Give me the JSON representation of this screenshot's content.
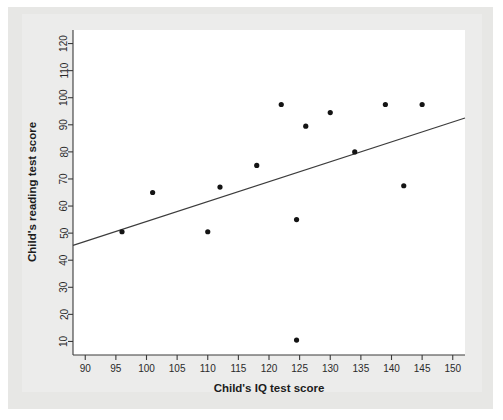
{
  "figure": {
    "background_color": "#e7e7e5",
    "panel_color": "#ececeb",
    "plot_background": "#ffffff"
  },
  "chart_data": {
    "type": "scatter",
    "title": "",
    "xlabel": "Child's IQ test score",
    "ylabel": "Child's reading test score",
    "xlim": [
      88,
      152
    ],
    "ylim": [
      5,
      125
    ],
    "xticks": [
      90,
      95,
      100,
      105,
      110,
      115,
      120,
      125,
      130,
      135,
      140,
      145,
      150
    ],
    "yticks": [
      10,
      20,
      30,
      40,
      50,
      60,
      70,
      80,
      90,
      100,
      110,
      120
    ],
    "xtick_labels": [
      "90",
      "95",
      "100",
      "105",
      "110",
      "115",
      "120",
      "125",
      "130",
      "135",
      "140",
      "145",
      "150"
    ],
    "ytick_labels": [
      "10",
      "20",
      "30",
      "40",
      "50",
      "60",
      "70",
      "80",
      "90",
      "100",
      "110",
      "120"
    ],
    "grid": false,
    "legend": null,
    "marker_color": "#141414",
    "line_color": "#3c3c3c",
    "points": [
      {
        "x": 96,
        "y": 50.5
      },
      {
        "x": 101,
        "y": 65
      },
      {
        "x": 110,
        "y": 50.5
      },
      {
        "x": 112,
        "y": 67
      },
      {
        "x": 118,
        "y": 75
      },
      {
        "x": 122,
        "y": 97.5
      },
      {
        "x": 124.5,
        "y": 10.5
      },
      {
        "x": 124.5,
        "y": 55
      },
      {
        "x": 126,
        "y": 89.5
      },
      {
        "x": 130,
        "y": 94.5
      },
      {
        "x": 134,
        "y": 80
      },
      {
        "x": 139,
        "y": 97.5
      },
      {
        "x": 142,
        "y": 67.5
      },
      {
        "x": 145,
        "y": 97.5
      }
    ],
    "fit_line": {
      "label": "regression line",
      "x_start": 88,
      "y_start": 45.5,
      "x_end": 152,
      "y_end": 92.5
    }
  }
}
